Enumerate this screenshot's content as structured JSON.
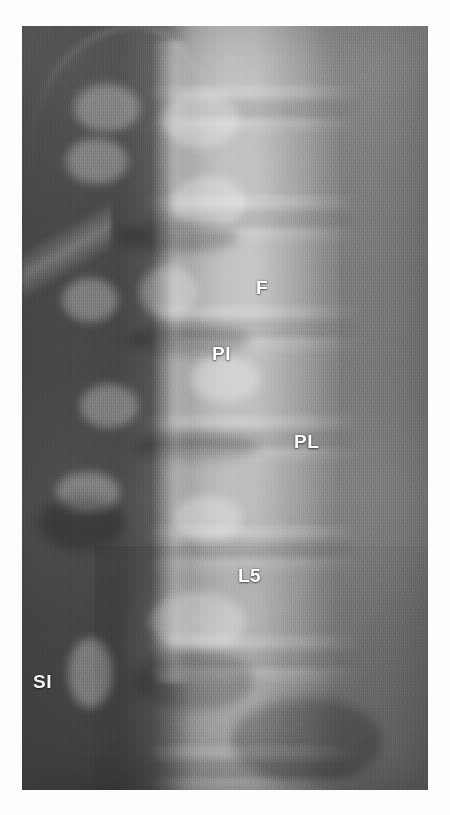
{
  "image": {
    "kind": "radiograph",
    "modality": "x-ray",
    "region": "lumbar-spine",
    "view": "anteroposterior-oblique",
    "canvas": {
      "width": 450,
      "height": 815
    },
    "plate": {
      "left": 22,
      "top": 26,
      "width": 406,
      "height": 764
    },
    "background_color": "#fdfdfd",
    "label_color": "#ffffff"
  },
  "annotations": [
    {
      "id": "facet-joint",
      "label": "F",
      "meaning": "facet joint",
      "x": 256,
      "y": 278
    },
    {
      "id": "pars-interarticularis",
      "label": "PI",
      "meaning": "pars interarticularis",
      "x": 212,
      "y": 344
    },
    {
      "id": "pedicle-lamina",
      "label": "PL",
      "meaning": "pedicle / lamina",
      "x": 294,
      "y": 432
    },
    {
      "id": "l5-vertebra",
      "label": "L5",
      "meaning": "fifth lumbar vertebra",
      "x": 238,
      "y": 566
    },
    {
      "id": "sacroiliac-joint",
      "label": "SI",
      "meaning": "sacroiliac joint",
      "x": 33,
      "y": 672
    }
  ],
  "anatomy_overlays": {
    "bright_blobs": [
      {
        "name": "facet-upper",
        "left": 52,
        "top": 58,
        "width": 66,
        "height": 48
      },
      {
        "name": "facet-upper-2",
        "left": 44,
        "top": 112,
        "width": 62,
        "height": 46
      },
      {
        "name": "pedicle-right-1",
        "left": 140,
        "top": 66,
        "width": 78,
        "height": 56
      },
      {
        "name": "pedicle-right-2",
        "left": 150,
        "top": 150,
        "width": 74,
        "height": 54
      },
      {
        "name": "facet-mid",
        "left": 118,
        "top": 240,
        "width": 58,
        "height": 52
      },
      {
        "name": "pars-left",
        "left": 40,
        "top": 252,
        "width": 56,
        "height": 44
      },
      {
        "name": "lamina-right",
        "left": 168,
        "top": 330,
        "width": 70,
        "height": 46
      },
      {
        "name": "facet-lower",
        "left": 58,
        "top": 358,
        "width": 58,
        "height": 44
      },
      {
        "name": "transverse-process",
        "left": 34,
        "top": 446,
        "width": 64,
        "height": 40
      },
      {
        "name": "l5-pedicle",
        "left": 152,
        "top": 470,
        "width": 68,
        "height": 44
      },
      {
        "name": "sacral-ala",
        "left": 128,
        "top": 566,
        "width": 96,
        "height": 58
      },
      {
        "name": "si-joint-edge",
        "left": 46,
        "top": 612,
        "width": 44,
        "height": 70
      }
    ],
    "dark_blobs": [
      {
        "name": "disc-space-1",
        "left": 96,
        "top": 196,
        "width": 120,
        "height": 30
      },
      {
        "name": "disc-space-2",
        "left": 104,
        "top": 300,
        "width": 124,
        "height": 28
      },
      {
        "name": "disc-space-3",
        "left": 110,
        "top": 408,
        "width": 128,
        "height": 26
      },
      {
        "name": "bowel-gas-left",
        "left": 16,
        "top": 470,
        "width": 86,
        "height": 54
      },
      {
        "name": "bowel-gas-lower",
        "left": 112,
        "top": 624,
        "width": 120,
        "height": 60
      },
      {
        "name": "pelvis-shadow",
        "left": 210,
        "top": 672,
        "width": 150,
        "height": 86
      }
    ]
  }
}
